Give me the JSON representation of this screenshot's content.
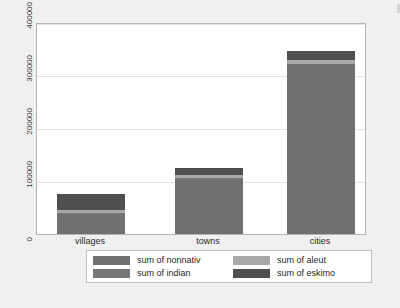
{
  "window": {
    "background_color": "#f0f0f0",
    "plot_background_color": "#ffffff",
    "plot_border_color": "#b4b4b4"
  },
  "chart_data": {
    "type": "bar",
    "stacked": true,
    "title": "",
    "subtitle": "",
    "xlabel": "",
    "ylabel": "",
    "categories": [
      "villages",
      "towns",
      "cities"
    ],
    "ylim": [
      0,
      400000
    ],
    "ytick_labels": [
      "0",
      "100000",
      "200000",
      "300000",
      "400000"
    ],
    "ytick_values": [
      0,
      100000,
      200000,
      300000,
      400000
    ],
    "grid": true,
    "grid_axis": "y",
    "legend_position": "bottom",
    "legend_columns": 2,
    "series": [
      {
        "name": "sum of nonnativ",
        "color": "#707070",
        "values": [
          38000,
          104000,
          320000
        ]
      },
      {
        "name": "sum of indian",
        "color": "#787878",
        "values": [
          2000,
          2500,
          1500
        ]
      },
      {
        "name": "sum of aleut",
        "color": "#a8a8a8",
        "values": [
          5000,
          4500,
          7500
        ]
      },
      {
        "name": "sum of eskimo",
        "color": "#4f4f4f",
        "values": [
          30000,
          14000,
          16000
        ]
      }
    ],
    "totals": [
      75000,
      125000,
      345000
    ]
  },
  "legend": {
    "entries": [
      {
        "label": "sum of nonnativ",
        "color": "#707070",
        "icon": "legend-swatch-icon"
      },
      {
        "label": "sum of aleut",
        "color": "#a8a8a8",
        "icon": "legend-swatch-icon"
      },
      {
        "label": "sum of indian",
        "color": "#787878",
        "icon": "legend-swatch-icon"
      },
      {
        "label": "sum of eskimo",
        "color": "#4f4f4f",
        "icon": "legend-swatch-icon"
      }
    ]
  }
}
